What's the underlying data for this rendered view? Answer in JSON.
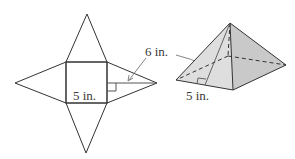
{
  "figure": {
    "net": {
      "base_label": "5 in.",
      "slant_label": "6 in.",
      "square": {
        "x": 66,
        "y": 62,
        "size": 41
      },
      "apexes": {
        "top": [
          87,
          14
        ],
        "left": [
          15,
          83
        ],
        "bottom": [
          86,
          153
        ],
        "right": [
          157,
          83
        ]
      }
    },
    "pyramid": {
      "base_label": "5 in.",
      "apex": [
        230,
        23
      ],
      "front_left": [
        176,
        80
      ],
      "front_right": [
        233,
        90
      ],
      "right": [
        286,
        65
      ],
      "back": [
        228,
        56
      ],
      "slant_foot": [
        205,
        85
      ]
    },
    "colors": {
      "line": "#333333",
      "arrow": "#777777",
      "front_face": "#dedede",
      "right_face": "#c9c9c9",
      "text": "#3a3a3a"
    }
  }
}
